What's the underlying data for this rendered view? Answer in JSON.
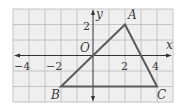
{
  "diagram": {
    "type": "coordinate-grid-triangle",
    "axes": {
      "x_label": "x",
      "y_label": "y",
      "origin_label": "O"
    },
    "x_ticks": [
      {
        "value": -4,
        "label": "−4"
      },
      {
        "value": -2,
        "label": "−2"
      },
      {
        "value": 2,
        "label": "2"
      },
      {
        "value": 4,
        "label": "4"
      }
    ],
    "y_ticks": [
      {
        "value": 2,
        "label": "2"
      }
    ],
    "grid": {
      "x_range": [
        -5,
        5
      ],
      "y_range": [
        -3,
        3
      ],
      "step": 1
    },
    "vertices": [
      {
        "name": "A",
        "x": 2,
        "y": 3
      },
      {
        "name": "B",
        "x": -2,
        "y": -2
      },
      {
        "name": "C",
        "x": 4,
        "y": -2
      }
    ],
    "colors": {
      "grid": "#c8c8c8",
      "grid_bg": "#eeeeee",
      "triangle": "#5a5a5a",
      "axis": "#333333"
    }
  }
}
